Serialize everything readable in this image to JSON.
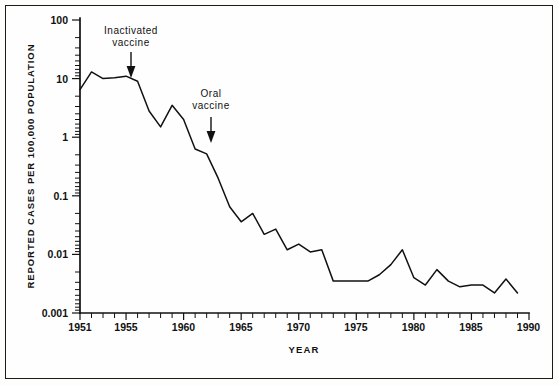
{
  "chart_data": {
    "type": "line",
    "title": "",
    "xlabel": "YEAR",
    "ylabel": "REPORTED CASES PER 100,000 POPULATION",
    "yscale": "log",
    "ylim": [
      0.001,
      100
    ],
    "xlim": [
      1951,
      1990
    ],
    "grid": false,
    "legend": null,
    "ytick_labels": [
      "100",
      "10",
      "1",
      "0.1",
      "0.01",
      "0.001"
    ],
    "ytick_values": [
      100,
      10,
      1,
      0.1,
      0.01,
      0.001
    ],
    "xtick_labels": [
      "1951",
      "1955",
      "1960",
      "1965",
      "1970",
      "1975",
      "1980",
      "1985",
      "1990"
    ],
    "xtick_values": [
      1951,
      1955,
      1960,
      1965,
      1970,
      1975,
      1980,
      1985,
      1990
    ],
    "x": [
      1951,
      1952,
      1953,
      1954,
      1955,
      1956,
      1957,
      1958,
      1959,
      1960,
      1961,
      1962,
      1963,
      1964,
      1965,
      1966,
      1967,
      1968,
      1969,
      1970,
      1971,
      1972,
      1973,
      1974,
      1975,
      1976,
      1977,
      1978,
      1979,
      1980,
      1981,
      1982,
      1983,
      1984,
      1985,
      1986,
      1987,
      1988,
      1989
    ],
    "values": [
      6.5,
      13.0,
      10.0,
      10.3,
      11.0,
      9.0,
      2.8,
      1.5,
      3.5,
      2.0,
      0.63,
      0.52,
      0.2,
      0.065,
      0.036,
      0.05,
      0.022,
      0.027,
      0.012,
      0.015,
      0.011,
      0.012,
      0.0035,
      0.0035,
      0.0035,
      0.0035,
      0.0045,
      0.0067,
      0.012,
      0.004,
      0.003,
      0.0055,
      0.0035,
      0.0028,
      0.003,
      0.003,
      0.0022,
      0.0038,
      0.0022
    ],
    "annotations": [
      {
        "label_line1": "Inactivated",
        "label_line2": "vaccine",
        "year": 1955,
        "arrow": "down"
      },
      {
        "label_line1": "Oral",
        "label_line2": "vaccine",
        "year": 1961,
        "arrow": "down"
      }
    ],
    "series_color": "#111111"
  },
  "figure": {
    "background": "#fdfdfc",
    "frame_color": "#1a1a1a"
  }
}
